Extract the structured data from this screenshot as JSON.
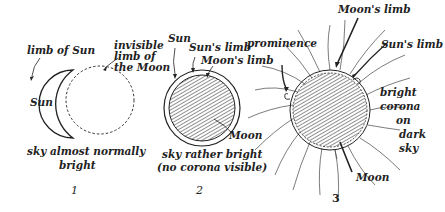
{
  "panels": [
    {
      "number": "1",
      "labels": {
        "limb_of_sun": "limb of Sun",
        "invisible_limb_1": "invisible",
        "invisible_limb_2": "limb of",
        "invisible_limb_3": "the Moon",
        "sun": "Sun",
        "caption_1": "sky almost normally",
        "caption_2": "bright"
      }
    },
    {
      "number": "2",
      "labels": {
        "sun": "Sun",
        "suns_limb": "Sun's limb",
        "moons_limb": "Moon's limb",
        "moon": "Moon",
        "caption_1": "sky rather bright",
        "caption_2": "(no corona visible)"
      }
    },
    {
      "number": "3",
      "labels": {
        "prominence": "prominence",
        "moons_limb": "Moon's limb",
        "suns_limb": "Sun's limb",
        "bright": "bright",
        "corona": "corona",
        "on": "on",
        "dark": "dark",
        "sky": "sky",
        "moon": "Moon"
      }
    }
  ],
  "colors": {
    "ink": "#222222",
    "background": "#ffffff"
  }
}
